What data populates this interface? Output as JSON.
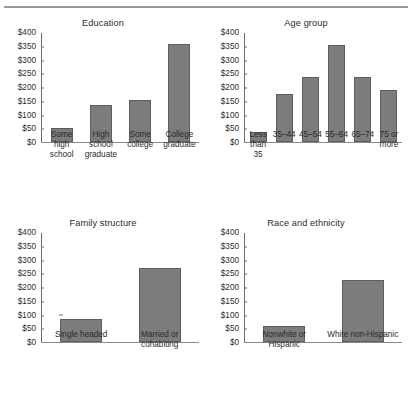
{
  "figure": {
    "top_rule": true,
    "bar_color": "#7c7c7c",
    "bar_edge_color": "#5e5e5e",
    "axis_color": "#6d6d6d",
    "text_color": "#231f20"
  },
  "chart_data": [
    {
      "type": "bar",
      "title": "Education",
      "categories": [
        "Some high school",
        "High school graduate",
        "Some college",
        "College graduate"
      ],
      "category_lines": [
        [
          "Some",
          "high",
          "school"
        ],
        [
          "High",
          "school",
          "graduate"
        ],
        [
          "Some",
          "college"
        ],
        [
          "College",
          "graduate"
        ]
      ],
      "values": [
        50,
        135,
        153,
        357
      ],
      "xlabel": "",
      "ylabel": "",
      "ylim": [
        0,
        400
      ],
      "yticks": [
        0,
        50,
        100,
        150,
        200,
        250,
        300,
        350,
        400
      ],
      "ytick_labels": [
        "$0",
        "$50",
        "$100",
        "$150",
        "$200",
        "$250",
        "$300",
        "$350",
        "$400"
      ],
      "grid": false,
      "legend": false
    },
    {
      "type": "bar",
      "title": "Age group",
      "categories": [
        "Less than 35",
        "35–44",
        "45–54",
        "55–64",
        "65–74",
        "75 or more"
      ],
      "category_lines": [
        [
          "Less",
          "than",
          "35"
        ],
        [
          "35–44"
        ],
        [
          "45–54"
        ],
        [
          "55–64"
        ],
        [
          "65–74"
        ],
        [
          "75 or",
          "more"
        ]
      ],
      "values": [
        38,
        175,
        237,
        352,
        235,
        188
      ],
      "xlabel": "",
      "ylabel": "",
      "ylim": [
        0,
        400
      ],
      "yticks": [
        0,
        50,
        100,
        150,
        200,
        250,
        300,
        350,
        400
      ],
      "ytick_labels": [
        "$0",
        "$50",
        "$100",
        "$150",
        "$200",
        "$250",
        "$300",
        "$350",
        "$400"
      ],
      "grid": false,
      "legend": false
    },
    {
      "type": "bar",
      "title": "Family structure",
      "categories": [
        "Single headed",
        "Married or cohabiting"
      ],
      "category_lines": [
        [
          "Single headed"
        ],
        [
          "Married or",
          "cohabiting"
        ]
      ],
      "values": [
        85,
        268
      ],
      "xlabel": "",
      "ylabel": "",
      "ylim": [
        0,
        400
      ],
      "yticks": [
        0,
        50,
        100,
        150,
        200,
        250,
        300,
        350,
        400
      ],
      "ytick_labels": [
        "$0",
        "$50",
        "$100",
        "$150",
        "$200",
        "$250",
        "$300",
        "$350",
        "$400"
      ],
      "grid": false,
      "legend": false
    },
    {
      "type": "bar",
      "title": "Race and ethnicity",
      "categories": [
        "Nonwhite or Hispanic",
        "White non-Hispanic"
      ],
      "category_lines": [
        [
          "Nonwhite or",
          "Hispanic"
        ],
        [
          "White non-Hispanic"
        ]
      ],
      "values": [
        60,
        225
      ],
      "xlabel": "",
      "ylabel": "",
      "ylim": [
        0,
        400
      ],
      "yticks": [
        0,
        50,
        100,
        150,
        200,
        250,
        300,
        350,
        400
      ],
      "ytick_labels": [
        "$0",
        "$50",
        "$100",
        "$150",
        "$200",
        "$250",
        "$300",
        "$350",
        "$400"
      ],
      "grid": false,
      "legend": false
    }
  ]
}
